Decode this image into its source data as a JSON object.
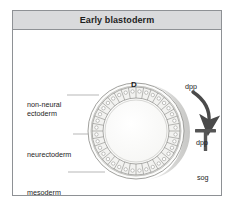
{
  "figure": {
    "title": "Early blastoderm",
    "type": "embryo-cross-section-diagram",
    "colors": {
      "title_bar_bg": "#d9dadc",
      "frame_border": "#8e9195",
      "canvas_bg": "#ffffff",
      "cell_fill": "#f2f2f0",
      "cell_stroke": "#8a8a86",
      "yolk_fill": "#fbfbfa",
      "shadow_fill": "#d8d8d6",
      "arrow_fill": "#4a4a4a",
      "tbar_fill": "#555555",
      "leader_line": "#9a9a9a",
      "text": "#1d1d1d"
    }
  },
  "embryo": {
    "name": "early-blastoderm-cross-section",
    "center": {
      "x": 123,
      "y": 120
    },
    "outer_radius": 48,
    "cell_ring_outer_radius": 44,
    "cell_ring_inner_radius": 33,
    "yolk_radius": 31,
    "cell_count": 36,
    "nucleus_radius": 1.7,
    "axis_markers": {
      "dorsal": "D",
      "ventral": "V"
    }
  },
  "tissue_labels": [
    {
      "id": "non-neural-ectoderm",
      "line1": "non-neural",
      "line2": "ectoderm",
      "leader_y": 84
    },
    {
      "id": "neurectoderm",
      "line1": "neurectoderm",
      "line2": "",
      "leader_y": 123
    },
    {
      "id": "mesoderm",
      "line1": "mesoderm",
      "line2": "",
      "leader_y": 161
    }
  ],
  "signaling": {
    "gradient_arrow": {
      "id": "dpp-gradient-arrow",
      "label": "dpp",
      "direction": "curved-clockwise-down-right"
    },
    "target_label": "dpp",
    "inhibition": {
      "id": "sog-inhibits-dpp",
      "inhibitor": "sog",
      "target": "dpp",
      "connector": "T-bar"
    }
  }
}
